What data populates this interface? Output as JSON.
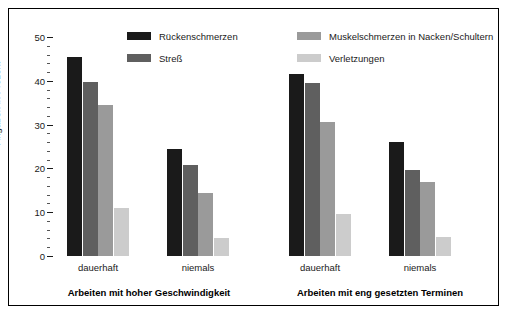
{
  "chart_data": {
    "type": "bar",
    "title": "",
    "xlabel": "",
    "ylabel": "Angaben in Prozent",
    "ylim": [
      0,
      50
    ],
    "ytick_labels": [
      "0",
      "10",
      "20",
      "30",
      "40",
      "50"
    ],
    "ytick_values": [
      0,
      10,
      20,
      30,
      40,
      50
    ],
    "minor_tick_step": 2,
    "grid": false,
    "legend_position": "top-center",
    "series": [
      {
        "name": "Rückenschmerzen",
        "color": "#1a1a1a",
        "values": [
          45.5,
          24.5,
          41.5,
          26.0
        ]
      },
      {
        "name": "Streß",
        "color": "#5f5f5f",
        "values": [
          39.7,
          20.7,
          39.5,
          19.7
        ]
      },
      {
        "name": "Muskelschmerzen in Nacken/Schultern",
        "color": "#9a9a9a",
        "values": [
          34.5,
          14.5,
          30.5,
          16.8
        ]
      },
      {
        "name": "Verletzungen",
        "color": "#cccccc",
        "values": [
          10.9,
          4.0,
          9.6,
          4.4
        ]
      }
    ],
    "panels": [
      {
        "title": "Arbeiten mit hoher Geschwindigkeit",
        "categories": [
          "dauerhaft",
          "niemals"
        ],
        "values": {
          "dauerhaft": [
            45.5,
            39.7,
            34.5,
            10.9
          ],
          "niemals": [
            24.5,
            20.7,
            14.5,
            4.0
          ]
        }
      },
      {
        "title": "Arbeiten mit eng gesetzten Terminen",
        "categories": [
          "dauerhaft",
          "niemals"
        ],
        "values": {
          "dauerhaft": [
            41.5,
            39.5,
            30.5,
            9.6
          ],
          "niemals": [
            26.0,
            19.7,
            16.8,
            4.4
          ]
        }
      }
    ]
  },
  "legend": {
    "items": [
      {
        "label": "Rückenschmerzen",
        "color": "#1a1a1a"
      },
      {
        "label": "Streß",
        "color": "#5f5f5f"
      },
      {
        "label": "Muskelschmerzen in Nacken/Schultern",
        "color": "#9a9a9a"
      },
      {
        "label": "Verletzungen",
        "color": "#cccccc"
      }
    ]
  },
  "axis": {
    "y_title": "Angaben in Prozent",
    "ticks": [
      "50",
      "40",
      "30",
      "20",
      "10",
      "0"
    ]
  },
  "panels": {
    "left": {
      "title": "Arbeiten mit hoher Geschwindigkeit",
      "cat1": "dauerhaft",
      "cat2": "niemals"
    },
    "right": {
      "title": "Arbeiten mit eng gesetzten Terminen",
      "cat1": "dauerhaft",
      "cat2": "niemals"
    }
  }
}
